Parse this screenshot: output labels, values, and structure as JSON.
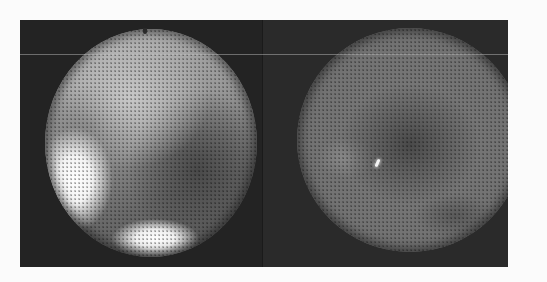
{
  "figure": {
    "panels": [
      {
        "id": "left",
        "description": "Circular fiberscope view with bright white specular highlights at lower-left and bottom",
        "highlights": 2
      },
      {
        "id": "right",
        "description": "Circular fiberscope view, uniformly gray with a small bright glint near center",
        "highlights": 1
      }
    ],
    "colors": {
      "page_background": "#fbfbfb",
      "frame_background": "#262626",
      "highlight": "#ffffff"
    }
  }
}
